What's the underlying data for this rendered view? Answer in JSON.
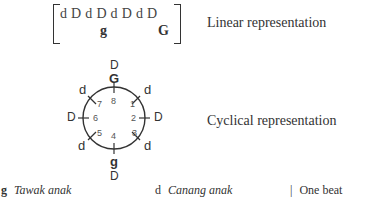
{
  "linear": {
    "sequence": "d D d D d D d D",
    "sub_left": "g",
    "sub_right": "G",
    "label": "Linear representation"
  },
  "cyclical": {
    "label": "Cyclical representation",
    "top_outer": "D",
    "top_inner": "G",
    "bottom_inner": "g",
    "bottom_outer": "D",
    "positions": [
      {
        "num": "1",
        "outer": "d"
      },
      {
        "num": "2",
        "outer": "D"
      },
      {
        "num": "3",
        "outer": "d"
      },
      {
        "num": "4",
        "outer": "g"
      },
      {
        "num": "5",
        "outer": "d"
      },
      {
        "num": "6",
        "outer": "D"
      },
      {
        "num": "7",
        "outer": "d"
      },
      {
        "num": "8",
        "outer": "G"
      }
    ]
  },
  "legend": {
    "items": [
      {
        "symbol": "g",
        "text": "Tawak anak"
      },
      {
        "symbol": "d",
        "text": "Canang anak"
      },
      {
        "symbol": "|",
        "text": "One beat"
      }
    ]
  }
}
